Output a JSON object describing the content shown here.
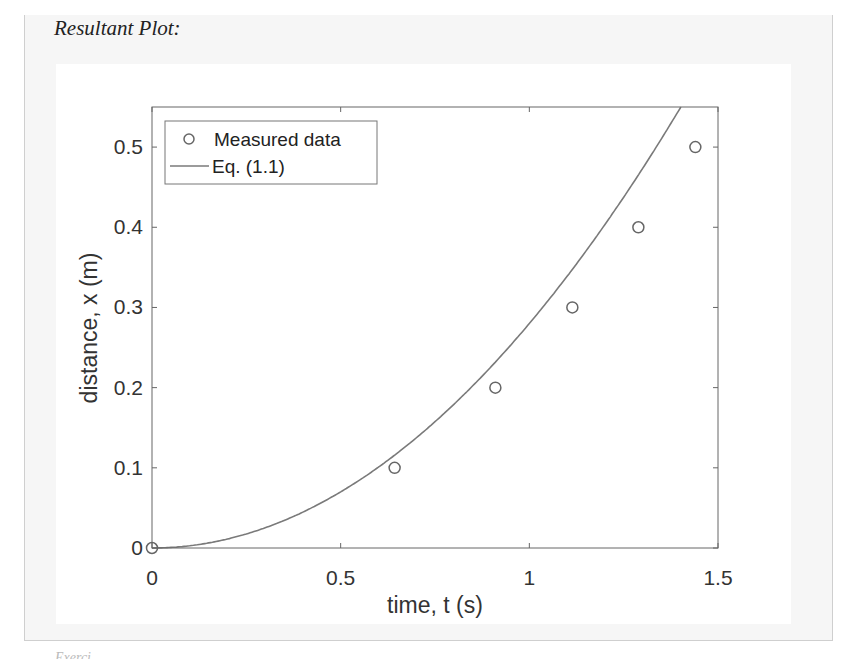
{
  "caption": "Resultant Plot:",
  "footer_fragment": "Exerci",
  "colors": {
    "curve": "#7a7a7a",
    "markers": "#666666",
    "axes": "#555555",
    "frame_border": "#cfcfcf",
    "frame_bg": "#f6f6f6"
  },
  "chart_data": {
    "type": "line",
    "title": "",
    "xlabel": "time, t (s)",
    "ylabel": "distance, x (m)",
    "xlim": [
      0,
      1.5
    ],
    "ylim": [
      0,
      0.55
    ],
    "xticks": [
      0,
      0.5,
      1,
      1.5
    ],
    "xtick_labels": [
      "0",
      "0.5",
      "1",
      "1.5"
    ],
    "yticks": [
      0,
      0.1,
      0.2,
      0.3,
      0.4,
      0.5
    ],
    "ytick_labels": [
      "0",
      "0.1",
      "0.2",
      "0.3",
      "0.4",
      "0.5"
    ],
    "grid": false,
    "legend_position": "upper left",
    "series": [
      {
        "name": "Measured data",
        "style": "markers-open-circle",
        "x": [
          0,
          0.643,
          0.91,
          1.114,
          1.289,
          1.44
        ],
        "y": [
          0,
          0.1,
          0.2,
          0.3,
          0.4,
          0.5
        ]
      },
      {
        "name": "Eq. (1.1)",
        "style": "line",
        "equation": "x = 0.28 t^2",
        "x": [
          0,
          0.1,
          0.2,
          0.3,
          0.4,
          0.5,
          0.6,
          0.7,
          0.8,
          0.9,
          1.0,
          1.1,
          1.2,
          1.3,
          1.4
        ],
        "y": [
          0,
          0.0028,
          0.0112,
          0.0252,
          0.0448,
          0.07,
          0.1008,
          0.1372,
          0.1792,
          0.2268,
          0.28,
          0.3388,
          0.4032,
          0.4732,
          0.5488
        ]
      }
    ]
  }
}
